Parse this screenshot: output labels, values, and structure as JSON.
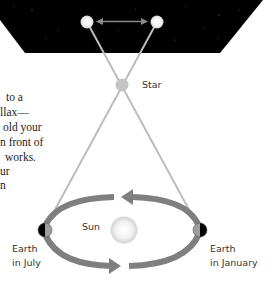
{
  "diagram": {
    "labels": {
      "star": "Star",
      "sun": "Sun",
      "earth_july_line1": "Earth",
      "earth_july_line2": "in July",
      "earth_january_line1": "Earth",
      "earth_january_line2": "in January"
    },
    "colors": {
      "sky": "#000000",
      "sightline": "#bdbdbd",
      "orbit_arrow": "#7f7f7f",
      "star_dot": "#c4c4c4",
      "earth_dark": "#000000",
      "earth_light": "#9e9e9e",
      "sun_core": "#ffffff",
      "sun_edge": "#d0d0d0"
    }
  },
  "body_text": {
    "lines": [
      "to a",
      "llax—",
      "old your",
      "n front of",
      "works.",
      "ur",
      "n"
    ]
  }
}
